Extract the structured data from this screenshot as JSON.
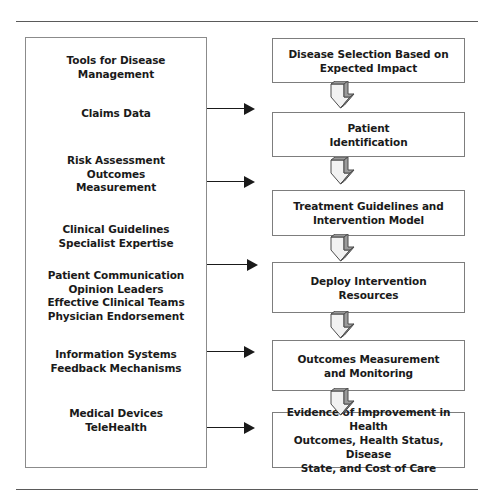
{
  "figure": {
    "colors": {
      "box_border": "#7d7d7d",
      "panel_border": "#8b8b8b",
      "rule": "#5a5a5a",
      "text": "#1a1a1a",
      "arrow_fill_front": "#f2f2f2",
      "arrow_fill_side": "#9a9a9a",
      "arrow_stroke": "#4d4d4d",
      "background": "#ffffff"
    }
  },
  "enablers": {
    "panel_name": "tools-and-enablers-panel",
    "items": [
      {
        "id": "tools-for-disease-management",
        "text": "Tools for Disease\nManagement",
        "top": 17
      },
      {
        "id": "claims-data",
        "text": "Claims Data",
        "top": 70
      },
      {
        "id": "risk-assessment-outcomes-measurement",
        "text": "Risk Assessment\nOutcomes\nMeasurement",
        "top": 117
      },
      {
        "id": "clinical-guidelines-specialist-expertise",
        "text": "Clinical Guidelines\nSpecialist Expertise",
        "top": 186
      },
      {
        "id": "patient-communication-group",
        "text": "Patient Communication\nOpinion Leaders\nEffective Clinical Teams\nPhysician Endorsement",
        "top": 232
      },
      {
        "id": "information-systems-feedback-mechanisms",
        "text": "Information Systems\nFeedback Mechanisms",
        "top": 311
      },
      {
        "id": "medical-devices-telehealth",
        "text": "Medical Devices\nTeleHealth",
        "top": 370
      }
    ]
  },
  "process": {
    "steps": [
      {
        "id": "disease-selection",
        "label": "Disease Selection Based on\nExpected Impact",
        "top": 38,
        "height": 45
      },
      {
        "id": "patient-identification",
        "label": "Patient\nIdentification",
        "top": 112,
        "height": 45
      },
      {
        "id": "treatment-guidelines",
        "label": "Treatment Guidelines and\nIntervention Model",
        "top": 190,
        "height": 46
      },
      {
        "id": "deploy-intervention-resources",
        "label": "Deploy Intervention\nResources",
        "top": 262,
        "height": 51
      },
      {
        "id": "outcomes-measurement-monitoring",
        "label": "Outcomes Measurement\nand Monitoring",
        "top": 340,
        "height": 51
      },
      {
        "id": "evidence-of-improvement",
        "label": "Evidence of Improvement in Health\nOutcomes, Health Status, Disease\nState, and Cost of Care",
        "top": 412,
        "height": 56
      }
    ]
  },
  "connectors": {
    "horizontal": [
      {
        "id": "arrow-to-patient-identification",
        "top": 103,
        "left": 207,
        "length": 48
      },
      {
        "id": "arrow-to-treatment-guidelines",
        "top": 176,
        "left": 207,
        "length": 48
      },
      {
        "id": "arrow-to-deploy-intervention",
        "top": 259,
        "left": 207,
        "length": 51
      },
      {
        "id": "arrow-to-outcomes-measurement",
        "top": 346,
        "left": 207,
        "length": 48
      },
      {
        "id": "arrow-to-evidence-of-improvement",
        "top": 422,
        "left": 207,
        "length": 48
      }
    ],
    "vertical": [
      {
        "id": "down-arrow-1",
        "top": 81,
        "left": 325
      },
      {
        "id": "down-arrow-2",
        "top": 157,
        "left": 325
      },
      {
        "id": "down-arrow-3",
        "top": 234,
        "left": 325
      },
      {
        "id": "down-arrow-4",
        "top": 311,
        "left": 325
      },
      {
        "id": "down-arrow-5",
        "top": 388,
        "left": 325
      }
    ]
  }
}
